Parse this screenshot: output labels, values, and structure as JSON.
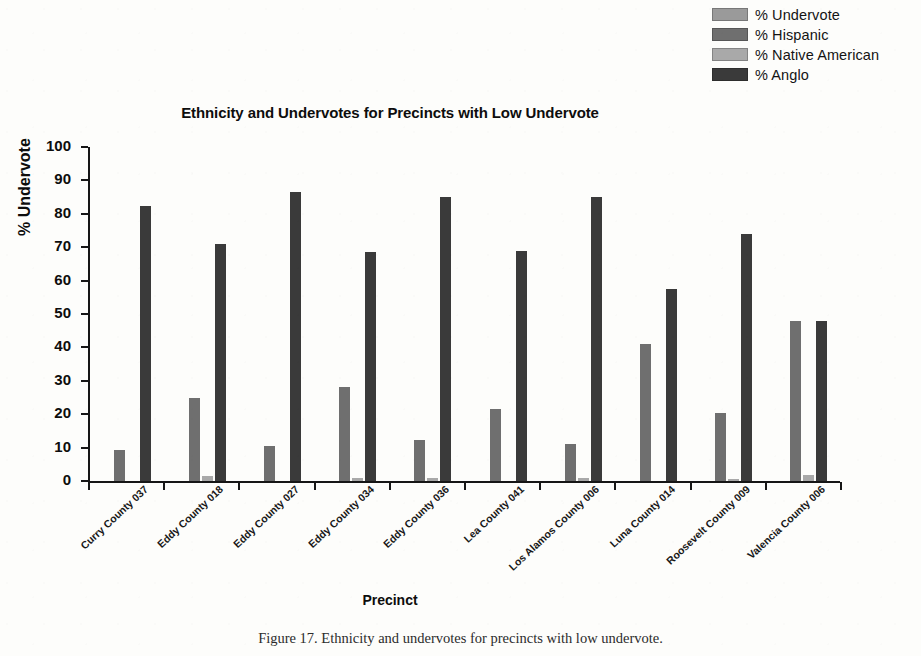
{
  "figure": {
    "caption": "Figure 17.  Ethnicity and undervotes for precincts with low undervote."
  },
  "chart_data": {
    "type": "bar",
    "title": "Ethnicity and Undervotes for Precincts with Low Undervote",
    "xlabel": "Precinct",
    "ylabel": "% Undervote",
    "ylim": [
      0,
      100
    ],
    "ytick_step": 10,
    "grid": false,
    "legend_position": "top-right",
    "yticks": [
      "100",
      "90",
      "80",
      "70",
      "60",
      "50",
      "40",
      "30",
      "20",
      "10",
      "0"
    ],
    "categories": [
      "Curry County 037",
      "Eddy County 018",
      "Eddy County 027",
      "Eddy County 034",
      "Eddy County 036",
      "Lea County 041",
      "Los Alamos County 006",
      "Luna County 014",
      "Roosevelt County 009",
      "Valencia County 006"
    ],
    "series": [
      {
        "name": "% Undervote",
        "color": "#9a9a9a",
        "values": [
          0,
          0,
          0,
          0,
          0,
          0,
          0,
          0,
          0,
          0
        ]
      },
      {
        "name": "% Hispanic",
        "color": "#6f6f6f",
        "values": [
          9.3,
          24.8,
          10.6,
          28.1,
          12.4,
          21.5,
          11.1,
          41.0,
          20.4,
          48.0
        ]
      },
      {
        "name": "% Native American",
        "color": "#a9a9a9",
        "values": [
          0,
          1.6,
          0,
          0.9,
          1.0,
          0,
          0.8,
          0,
          0.7,
          1.9
        ]
      },
      {
        "name": "% Anglo",
        "color": "#3a3a3a",
        "values": [
          82.3,
          71.0,
          86.4,
          68.6,
          85.0,
          69.0,
          85.0,
          57.6,
          74.0,
          48.0
        ]
      }
    ]
  },
  "legend": {
    "items": [
      {
        "label": "% Undervote",
        "color": "#9a9a9a"
      },
      {
        "label": "% Hispanic",
        "color": "#6f6f6f"
      },
      {
        "label": "% Native American",
        "color": "#a9a9a9"
      },
      {
        "label": "% Anglo",
        "color": "#3a3a3a"
      }
    ]
  }
}
